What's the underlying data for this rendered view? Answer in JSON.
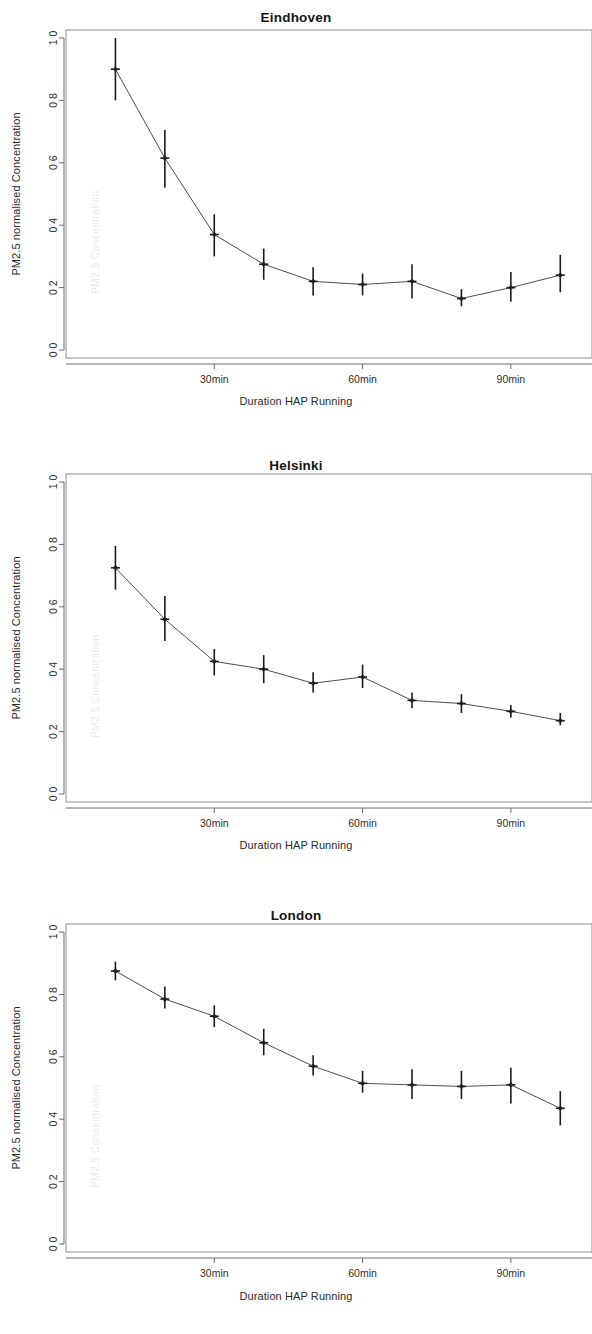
{
  "figure": {
    "panel_count": 3,
    "background_color": "#ffffff",
    "line_color": "#3a3a3a",
    "errorbar_color": "#1c1c1c",
    "axis_color": "#6d6d6d"
  },
  "chart_data": [
    {
      "type": "line",
      "title": "Eindhoven",
      "xlabel": "Duration HAP Running",
      "ylabel": "PM2.5 normalised Concentration",
      "grid": false,
      "legend": "none",
      "xlim": [
        0,
        105
      ],
      "ylim": [
        0.0,
        1.0
      ],
      "xtick_values": [
        30,
        60,
        90
      ],
      "xtick_labels": [
        "30min",
        "60min",
        "90min"
      ],
      "ytick_values": [
        0.0,
        0.2,
        0.4,
        0.6,
        0.8,
        1.0
      ],
      "ytick_labels": [
        "0 0",
        "0 2",
        "0 4",
        "0 6",
        "0 8",
        "1 0"
      ],
      "x": [
        10,
        20,
        30,
        40,
        50,
        60,
        70,
        80,
        90,
        100
      ],
      "values": [
        0.9,
        0.615,
        0.37,
        0.275,
        0.22,
        0.21,
        0.22,
        0.165,
        0.2,
        0.24
      ],
      "err_low": [
        0.8,
        0.52,
        0.3,
        0.225,
        0.175,
        0.175,
        0.165,
        0.14,
        0.155,
        0.185
      ],
      "err_high": [
        1.0,
        0.705,
        0.435,
        0.325,
        0.265,
        0.245,
        0.275,
        0.195,
        0.25,
        0.305
      ],
      "watermark": "PM2.5 Concentration"
    },
    {
      "type": "line",
      "title": "Helsinki",
      "xlabel": "Duration HAP Running",
      "ylabel": "PM2.5 normalised Concentration",
      "grid": false,
      "legend": "none",
      "xlim": [
        0,
        105
      ],
      "ylim": [
        0.0,
        1.0
      ],
      "xtick_values": [
        30,
        60,
        90
      ],
      "xtick_labels": [
        "30min",
        "60min",
        "90min"
      ],
      "ytick_values": [
        0.0,
        0.2,
        0.4,
        0.6,
        0.8,
        1.0
      ],
      "ytick_labels": [
        "0 0",
        "0 2",
        "0 4",
        "0 6",
        "0 8",
        "1 0"
      ],
      "x": [
        10,
        20,
        30,
        40,
        50,
        60,
        70,
        80,
        90,
        100
      ],
      "values": [
        0.725,
        0.56,
        0.425,
        0.4,
        0.355,
        0.375,
        0.3,
        0.29,
        0.265,
        0.235
      ],
      "err_low": [
        0.655,
        0.49,
        0.38,
        0.355,
        0.325,
        0.34,
        0.275,
        0.26,
        0.245,
        0.22
      ],
      "err_high": [
        0.795,
        0.635,
        0.465,
        0.445,
        0.39,
        0.415,
        0.325,
        0.32,
        0.285,
        0.26
      ],
      "watermark": "PM2.5 Concentration"
    },
    {
      "type": "line",
      "title": "London",
      "xlabel": "Duration HAP Running",
      "ylabel": "PM2.5 normalised Concentration",
      "grid": false,
      "legend": "none",
      "xlim": [
        0,
        105
      ],
      "ylim": [
        0.0,
        1.0
      ],
      "xtick_values": [
        30,
        60,
        90
      ],
      "xtick_labels": [
        "30min",
        "60min",
        "90min"
      ],
      "ytick_values": [
        0.0,
        0.2,
        0.4,
        0.6,
        0.8,
        1.0
      ],
      "ytick_labels": [
        "0 0",
        "0 2",
        "0 4",
        "0 6",
        "0 8",
        "1 0"
      ],
      "x": [
        10,
        20,
        30,
        40,
        50,
        60,
        70,
        80,
        90,
        100
      ],
      "values": [
        0.875,
        0.785,
        0.73,
        0.645,
        0.57,
        0.515,
        0.51,
        0.505,
        0.51,
        0.435
      ],
      "err_low": [
        0.845,
        0.755,
        0.695,
        0.605,
        0.54,
        0.485,
        0.465,
        0.465,
        0.45,
        0.38
      ],
      "err_high": [
        0.905,
        0.825,
        0.765,
        0.69,
        0.605,
        0.555,
        0.56,
        0.555,
        0.565,
        0.49
      ],
      "watermark": "PM2.5 Concentration"
    }
  ]
}
